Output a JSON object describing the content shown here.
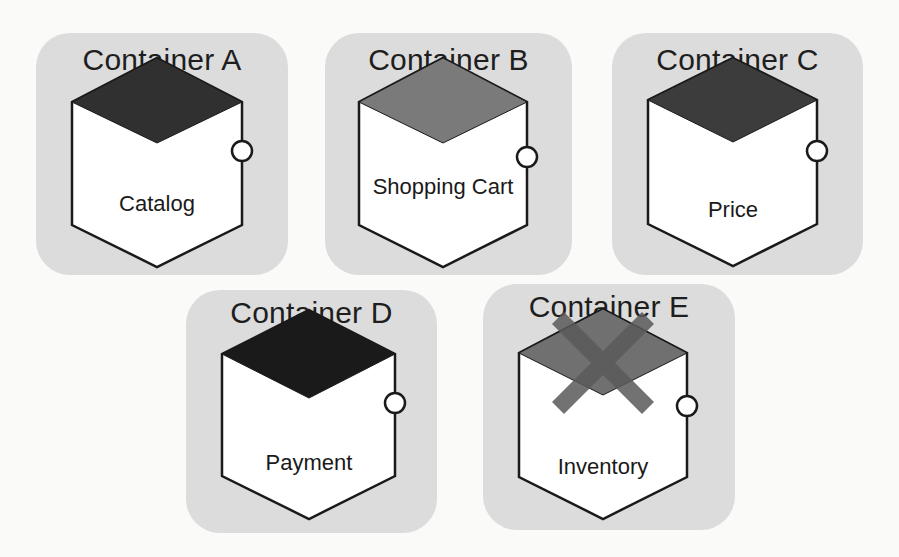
{
  "diagram": {
    "containers": [
      {
        "id": "A",
        "title": "Container A",
        "service": "Catalog",
        "top_color": "#303030",
        "failed": false
      },
      {
        "id": "B",
        "title": "Container B",
        "service": "Shopping Cart",
        "top_color": "#7a7a7a",
        "failed": false
      },
      {
        "id": "C",
        "title": "Container C",
        "service": "Price",
        "top_color": "#3c3c3c",
        "failed": false
      },
      {
        "id": "D",
        "title": "Container D",
        "service": "Payment",
        "top_color": "#1a1a1a",
        "failed": false
      },
      {
        "id": "E",
        "title": "Container E",
        "service": "Inventory",
        "top_color": "#707070",
        "failed": true,
        "failure_mark": "X"
      }
    ],
    "colors": {
      "container_background": "#dcdcdc",
      "cube_face": "#ffffff",
      "outline": "#1a1a1a",
      "failure_mark": "#5a5a5a"
    },
    "icons": {
      "interface_port": "circle-port-icon",
      "failure": "cross-icon"
    }
  }
}
